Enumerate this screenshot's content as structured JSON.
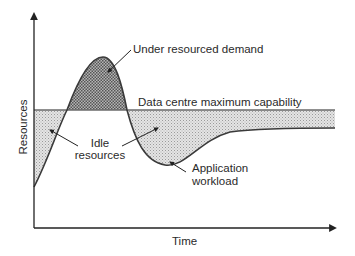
{
  "diagram": {
    "type": "capacity-vs-demand",
    "axes": {
      "y_label": "Resources",
      "x_label": "Time"
    },
    "series": [
      {
        "name": "Application workload",
        "kind": "curve"
      },
      {
        "name": "Data centre maximum capability",
        "kind": "horizontal-line"
      }
    ],
    "regions": [
      {
        "name": "Under resourced demand",
        "pattern": "dark-crosshatch"
      },
      {
        "name": "Idle resources",
        "pattern": "light-stipple"
      }
    ],
    "annotations": {
      "under_resourced": "Under resourced demand",
      "capacity": "Data centre maximum capability",
      "idle_line1": "Idle",
      "idle_line2": "resources",
      "workload_line1": "Application",
      "workload_line2": "workload"
    },
    "colors": {
      "line": "#3a3a3a",
      "capacity_line": "#6b6b6b",
      "under_fill": "#8a8a8a",
      "idle_fill": "#cfcfcf"
    }
  }
}
